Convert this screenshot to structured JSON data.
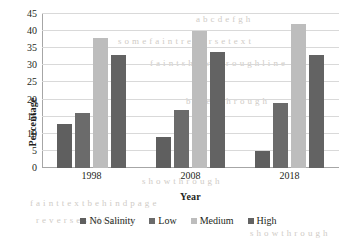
{
  "bleed_text": [
    {
      "t": "a  b c   d  e f  g   h",
      "x": 196,
      "y": 14
    },
    {
      "t": "s   o  m e   f a i n t   r e v e r s e   t e x t",
      "x": 118,
      "y": 36
    },
    {
      "t": "f a i n t   s h o w t h r o u g h   l i n e",
      "x": 150,
      "y": 58
    },
    {
      "t": "b l e e d   t h r o u g h",
      "x": 186,
      "y": 96
    },
    {
      "t": "s h o w t h r o u g h",
      "x": 142,
      "y": 176
    },
    {
      "t": "f a i n t   t e x t   b e h i n d   p a g e",
      "x": 30,
      "y": 198
    },
    {
      "t": "r e v e r s e   s i d e   t e x t",
      "x": 36,
      "y": 215
    },
    {
      "t": "s h o w   t h r o u g h",
      "x": 250,
      "y": 228
    }
  ],
  "chart_data": {
    "type": "bar",
    "title": "",
    "xlabel": "Year",
    "ylabel": "Percentage",
    "categories": [
      "1998",
      "2008",
      "2018"
    ],
    "series": [
      {
        "name": "No Salinity",
        "color": "#5f5f5f",
        "values": [
          13,
          9,
          5
        ]
      },
      {
        "name": "Low",
        "color": "#6b6b6b",
        "values": [
          16,
          17,
          19
        ]
      },
      {
        "name": "Medium",
        "color": "#bdbdbd",
        "values": [
          38,
          40,
          42
        ]
      },
      {
        "name": "High",
        "color": "#636363",
        "values": [
          33,
          34,
          33
        ]
      }
    ],
    "ylim": [
      0,
      45
    ],
    "ytick_step": 5,
    "yticks": [
      "0",
      "5",
      "10",
      "15",
      "20",
      "25",
      "30",
      "35",
      "40",
      "45"
    ],
    "grid": true,
    "legend_position": "bottom"
  }
}
